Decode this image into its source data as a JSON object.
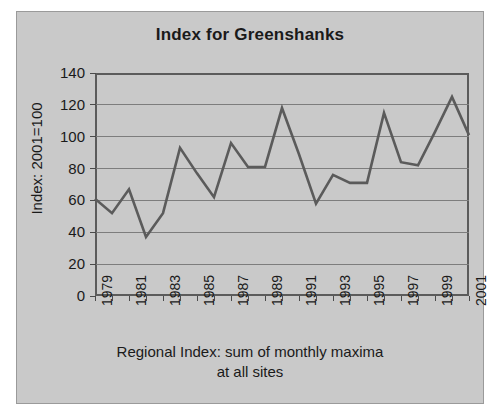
{
  "figure": {
    "background_color": "#c9c9c9",
    "border_color": "#9a9a9a",
    "line_color": "#5b5b5b",
    "text_color": "#1a1a1a"
  },
  "chart_data": {
    "type": "line",
    "title": "Index for Greenshanks",
    "subtitle": "",
    "xlabel": "Regional Index: sum of monthly maxima at all sites",
    "xlabel_line1": "Regional Index: sum of monthly maxima",
    "xlabel_line2": "at all sites",
    "ylabel": "Index: 2001=100",
    "ylim": [
      0,
      140
    ],
    "yticks": [
      0,
      20,
      40,
      60,
      80,
      100,
      120,
      140
    ],
    "ytick_labels": [
      "0",
      "20",
      "40",
      "60",
      "80",
      "100",
      "120",
      "140"
    ],
    "xlim": [
      1979,
      2001
    ],
    "xticks": [
      1979,
      1980,
      1981,
      1982,
      1983,
      1984,
      1985,
      1986,
      1987,
      1988,
      1989,
      1990,
      1991,
      1992,
      1993,
      1994,
      1995,
      1996,
      1997,
      1998,
      1999,
      2000,
      2001
    ],
    "xtick_labels": [
      "1979",
      "",
      "1981",
      "",
      "1983",
      "",
      "1985",
      "",
      "1987",
      "",
      "1989",
      "",
      "1991",
      "",
      "1993",
      "",
      "1995",
      "",
      "1997",
      "",
      "1999",
      "",
      "2001"
    ],
    "grid": true,
    "grid_axis": "y",
    "legend": false,
    "legend_position": "none",
    "series": [
      {
        "name": "Index for Greenshanks",
        "color": "#5b5b5b",
        "x": [
          1979,
          1980,
          1981,
          1982,
          1983,
          1984,
          1985,
          1986,
          1987,
          1988,
          1989,
          1990,
          1991,
          1992,
          1993,
          1994,
          1995,
          1996,
          1997,
          1998,
          1999,
          2000,
          2001
        ],
        "values": [
          61,
          52,
          67,
          37,
          52,
          93,
          77,
          62,
          96,
          81,
          81,
          118,
          89,
          58,
          76,
          71,
          71,
          115,
          84,
          82,
          103,
          125,
          101
        ]
      }
    ]
  }
}
